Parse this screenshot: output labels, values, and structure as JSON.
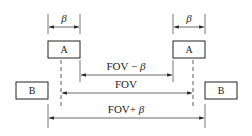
{
  "diagram": {
    "boxes": {
      "a_left": {
        "label": "A"
      },
      "a_right": {
        "label": "A"
      },
      "b_left": {
        "label": "B"
      },
      "b_right": {
        "label": "B"
      }
    },
    "dimensions": {
      "beta_left": {
        "label": "β"
      },
      "beta_right": {
        "label": "β"
      },
      "fov_minus_beta": {
        "prefix": "FOV − ",
        "symbol": "β"
      },
      "fov": {
        "label": "FOV"
      },
      "fov_plus_beta": {
        "prefix": "FOV+ ",
        "symbol": "β"
      }
    },
    "colors": {
      "line": "#333333",
      "box_stroke": "#222222",
      "background": "#ffffff"
    }
  }
}
